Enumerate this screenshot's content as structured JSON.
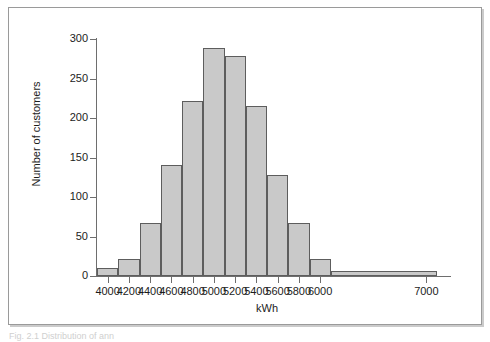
{
  "figure": {
    "background_color": "#ffffff",
    "frame_color": "#9a9a9a",
    "caption_partial": "Fig. 2.1  Distribution of ann"
  },
  "chart_data": {
    "type": "bar",
    "title": "",
    "subtitle": "",
    "xlabel": "kWh",
    "ylabel": "Number of customers",
    "grid": false,
    "legend": null,
    "bar_fill_color": "#c9c9c9",
    "bar_edge_color": "#5d5d5d",
    "axis_color": "#6e6e6e",
    "xlim": [
      3900,
      7100
    ],
    "ylim": [
      0,
      300
    ],
    "ytick_values": [
      0,
      50,
      100,
      150,
      200,
      250,
      300
    ],
    "ytick_labels": [
      "0",
      "50",
      "100",
      "150",
      "200",
      "250",
      "300"
    ],
    "xtick_values": [
      4000,
      4200,
      4400,
      4600,
      4800,
      5000,
      5200,
      5400,
      5600,
      5800,
      6000,
      7000
    ],
    "xtick_labels": [
      "4000",
      "4200",
      "4400",
      "4600",
      "4800",
      "5000",
      "5200",
      "5400",
      "5600",
      "5800",
      "6000",
      "7000"
    ],
    "bin_edges": [
      3900,
      4100,
      4300,
      4500,
      4700,
      4900,
      5100,
      5300,
      5500,
      5700,
      5900,
      6100,
      7100
    ],
    "categories": [
      "3900-4100",
      "4100-4300",
      "4300-4500",
      "4500-4700",
      "4700-4900",
      "4900-5100",
      "5100-5300",
      "5300-5500",
      "5500-5700",
      "5700-5900",
      "5900-6100",
      "6100-7100"
    ],
    "values": [
      10,
      22,
      67,
      140,
      222,
      289,
      278,
      215,
      128,
      67,
      22,
      6
    ]
  }
}
